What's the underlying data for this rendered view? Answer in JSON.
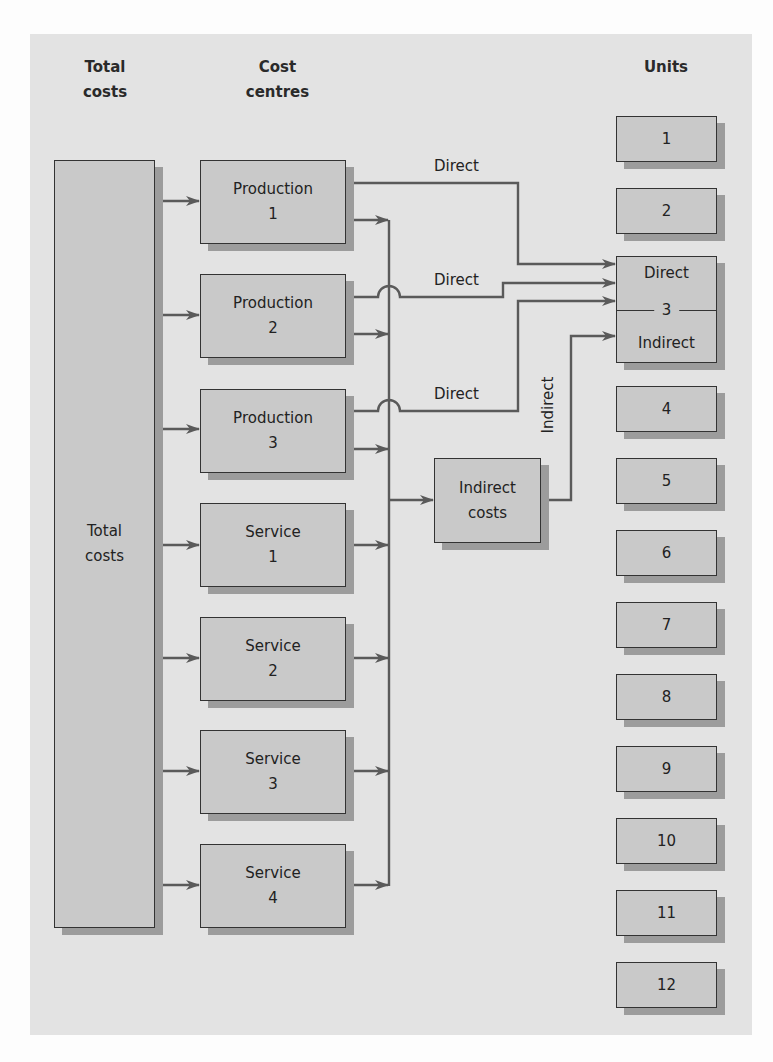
{
  "headings": {
    "total_costs": [
      "Total",
      "costs"
    ],
    "cost_centres": [
      "Cost",
      "centres"
    ],
    "units": "Units"
  },
  "total_costs_box": {
    "lines": [
      "Total",
      "costs"
    ]
  },
  "cost_centres": [
    {
      "id": "production-1",
      "lines": [
        "Production",
        "1"
      ]
    },
    {
      "id": "production-2",
      "lines": [
        "Production",
        "2"
      ]
    },
    {
      "id": "production-3",
      "lines": [
        "Production",
        "3"
      ]
    },
    {
      "id": "service-1",
      "lines": [
        "Service",
        "1"
      ]
    },
    {
      "id": "service-2",
      "lines": [
        "Service",
        "2"
      ]
    },
    {
      "id": "service-3",
      "lines": [
        "Service",
        "3"
      ]
    },
    {
      "id": "service-4",
      "lines": [
        "Service",
        "4"
      ]
    }
  ],
  "indirect_costs_box": {
    "lines": [
      "Indirect",
      "costs"
    ]
  },
  "flow_labels": {
    "direct_1": "Direct",
    "direct_2": "Direct",
    "direct_3": "Direct",
    "indirect": "Indirect"
  },
  "units": [
    {
      "label": "1"
    },
    {
      "label": "2"
    },
    {
      "label": "3",
      "top": "Direct",
      "bottom": "Indirect"
    },
    {
      "label": "4"
    },
    {
      "label": "5"
    },
    {
      "label": "6"
    },
    {
      "label": "7"
    },
    {
      "label": "8"
    },
    {
      "label": "9"
    },
    {
      "label": "10"
    },
    {
      "label": "11"
    },
    {
      "label": "12"
    }
  ],
  "colors": {
    "panel": "#e3e3e3",
    "box_fill": "#c9c9c9",
    "box_shadow": "#9c9c9c",
    "line": "#5a5a5a",
    "border": "#333333"
  }
}
